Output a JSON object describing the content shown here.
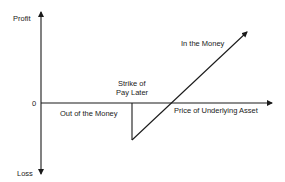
{
  "diagram": {
    "axes": {
      "y_top_label": "Profit",
      "y_bottom_label": "Loss",
      "origin_label": "0",
      "x_label": "Price of Underlying Asset"
    },
    "annotations": {
      "strike_line1": "Strike of",
      "strike_line2": "Pay Later",
      "out_of_money": "Out of the Money",
      "in_the_money": "In the Money"
    },
    "colors": {
      "line": "#1a1a1a",
      "background": "#ffffff"
    }
  }
}
